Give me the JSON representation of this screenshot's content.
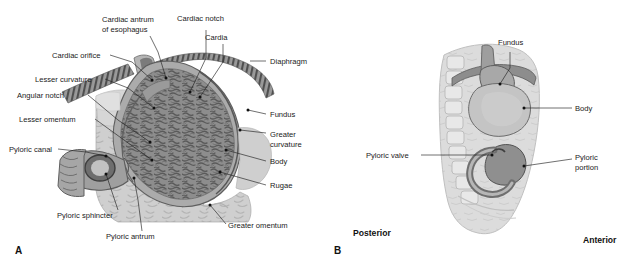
{
  "figure": {
    "panels": [
      {
        "id": "A",
        "letter": "A"
      },
      {
        "id": "B",
        "letter": "B"
      }
    ]
  },
  "colors": {
    "background": "#ffffff",
    "text": "#1a1a1a",
    "leader_line": "#222222",
    "omentum_light": "#d2d2d2",
    "omentum_mid": "#bdbdbd",
    "stomach_wall": "#9c9c9c",
    "stomach_wall_dark": "#6f6f6f",
    "rugae_fill": "#8d8d8d",
    "rugae_stroke": "#5d5d5d",
    "diaphragm": "#8a8a8a",
    "diaphragm_dark": "#4e4e4e",
    "esophagus_lumen": "#7b7b7b",
    "torso_light": "#dcdcdc",
    "torso_mid": "#c6c6c6",
    "vertebra": "#e6e6e6",
    "vertebra_stroke": "#b0b0b0",
    "stomach_b_light": "#c9c9c9",
    "stomach_b_mid": "#a8a8a8",
    "stomach_b_dark": "#848484",
    "duodenum_b": "#9a9a9a"
  },
  "panel_a": {
    "letter": "A",
    "labels": [
      {
        "id": "cardiac-antrum-of-esophagus",
        "line1": "Cardiac antrum",
        "line2": "of esophagus",
        "x": 102,
        "y": 22,
        "anchor": "start",
        "lines": 2
      },
      {
        "id": "cardiac-notch",
        "line1": "Cardiac notch",
        "line2": "",
        "x": 177,
        "y": 21,
        "anchor": "start",
        "lines": 1
      },
      {
        "id": "cardia",
        "line1": "Cardia",
        "line2": "",
        "x": 205,
        "y": 40,
        "anchor": "start",
        "lines": 1
      },
      {
        "id": "cardiac-orifice",
        "line1": "Cardiac orifice",
        "line2": "",
        "x": 52,
        "y": 58,
        "anchor": "start",
        "lines": 1
      },
      {
        "id": "diaphragm",
        "line1": "Diaphragm",
        "line2": "",
        "x": 268,
        "y": 64,
        "anchor": "start",
        "lines": 1
      },
      {
        "id": "lesser-curvature",
        "line1": "Lesser curvature",
        "line2": "",
        "x": 35,
        "y": 82,
        "anchor": "start",
        "lines": 1
      },
      {
        "id": "angular-notch",
        "line1": "Angular notch",
        "line2": "",
        "x": 17,
        "y": 98,
        "anchor": "start",
        "lines": 1
      },
      {
        "id": "fundus",
        "line1": "Fundus",
        "line2": "",
        "x": 268,
        "y": 117,
        "anchor": "start",
        "lines": 1
      },
      {
        "id": "lesser-omentum",
        "line1": "Lesser omentum",
        "line2": "",
        "x": 19,
        "y": 122,
        "anchor": "start",
        "lines": 1
      },
      {
        "id": "greater-curvature",
        "line1": "Greater",
        "line2": "curvature",
        "x": 268,
        "y": 137,
        "anchor": "start",
        "lines": 2
      },
      {
        "id": "pyloric-canal",
        "line1": "Pyloric canal",
        "line2": "",
        "x": 9,
        "y": 152,
        "anchor": "start",
        "lines": 1
      },
      {
        "id": "body",
        "line1": "Body",
        "line2": "",
        "x": 268,
        "y": 164,
        "anchor": "start",
        "lines": 1
      },
      {
        "id": "rugae",
        "line1": "Rugae",
        "line2": "",
        "x": 268,
        "y": 188,
        "anchor": "start",
        "lines": 1
      },
      {
        "id": "pyloric-sphincter",
        "line1": "Pyloric sphincter",
        "line2": "",
        "x": 57,
        "y": 215,
        "anchor": "start",
        "lines": 1
      },
      {
        "id": "greater-omentum",
        "line1": "Greater omentum",
        "line2": "",
        "x": 228,
        "y": 228,
        "anchor": "start",
        "lines": 1
      },
      {
        "id": "pyloric-antrum",
        "line1": "Pyloric antrum",
        "line2": "",
        "x": 106,
        "y": 237,
        "anchor": "start",
        "lines": 1
      }
    ]
  },
  "panel_b": {
    "letter": "B",
    "orientation": {
      "posterior": "Posterior",
      "anterior": "Anterior"
    },
    "labels": [
      {
        "id": "fundus",
        "line1": "Fundus",
        "line2": "",
        "x": 498,
        "y": 47,
        "anchor": "start",
        "lines": 1
      },
      {
        "id": "body",
        "line1": "Body",
        "line2": "",
        "x": 575,
        "y": 111,
        "anchor": "start",
        "lines": 1
      },
      {
        "id": "pyloric-valve",
        "line1": "Pyloric valve",
        "line2": "",
        "x": 369,
        "y": 158,
        "anchor": "start",
        "lines": 1
      },
      {
        "id": "pyloric-portion",
        "line1": "Pyloric",
        "line2": "portion",
        "x": 575,
        "y": 162,
        "anchor": "start",
        "lines": 2
      }
    ]
  }
}
